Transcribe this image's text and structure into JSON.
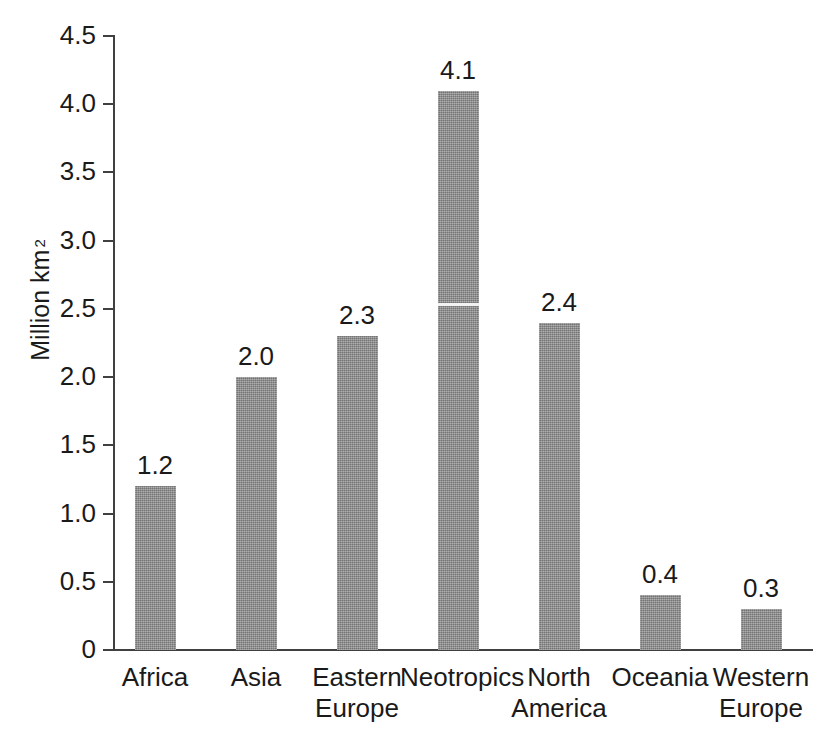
{
  "chart_data": {
    "type": "bar",
    "title": "",
    "xlabel": "",
    "ylabel": "Million km",
    "ylabel_superscript": "2",
    "categories": [
      "Africa",
      "Asia",
      "Eastern Europe",
      "Neotropics",
      "North America",
      "Oceania",
      "Western Europe"
    ],
    "category_lines": [
      [
        "Africa"
      ],
      [
        "Asia"
      ],
      [
        "Eastern",
        "Europe"
      ],
      [
        "Neotropics"
      ],
      [
        "North",
        "America"
      ],
      [
        "Oceania"
      ],
      [
        "Western",
        "Europe"
      ]
    ],
    "values": [
      1.2,
      2.0,
      2.3,
      4.1,
      2.4,
      0.4,
      0.3
    ],
    "value_labels": [
      "1.2",
      "2.0",
      "2.3",
      "4.1",
      "2.4",
      "0.4",
      "0.3"
    ],
    "ylim": [
      0,
      4.5
    ],
    "ytick_values": [
      0,
      0.5,
      1.0,
      1.5,
      2.0,
      2.5,
      3.0,
      3.5,
      4.0,
      4.5
    ],
    "ytick_labels": [
      "0",
      "0.5",
      "1.0",
      "1.5",
      "2.0",
      "2.5",
      "3.0",
      "3.5",
      "4.0",
      "4.5"
    ],
    "grid": false,
    "legend": false,
    "bar_color": "#8d8d8d",
    "axis_color": "#404040",
    "text_color": "#1a1a1a",
    "background": "#ffffff"
  }
}
